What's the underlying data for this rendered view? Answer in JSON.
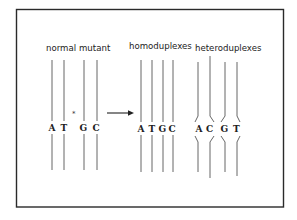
{
  "labels": {
    "normal": "normal",
    "mutant": "mutant",
    "homoduplexes": "homoduplexes",
    "heteroduplexes": "heteroduplexes"
  },
  "mutation_marker": "*",
  "groups": {
    "input": {
      "bases": [
        "A",
        "T",
        "G",
        "C"
      ]
    },
    "homoduplexes": {
      "bases": [
        "A",
        "T",
        "G",
        "C"
      ]
    },
    "heteroduplexes": {
      "bases": [
        "A",
        "C",
        "G",
        "T"
      ]
    }
  },
  "colors": {
    "line": "#555555",
    "text": "#222222",
    "frame": "#2a2a2a",
    "background": "#ffffff"
  }
}
